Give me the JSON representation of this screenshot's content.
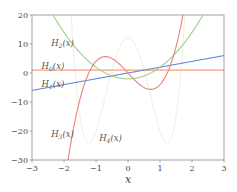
{
  "chart_data": {
    "type": "line",
    "title": "",
    "xlabel": "x",
    "ylabel": "",
    "xlim": [
      -3,
      3
    ],
    "ylim": [
      -30,
      20
    ],
    "xticks": [
      -3,
      -2,
      -1,
      0,
      1,
      2,
      3
    ],
    "yticks": [
      -30,
      -20,
      -10,
      0,
      10,
      20
    ],
    "xtick_labels": [
      "−3",
      "−2",
      "−1",
      "0",
      "1",
      "2",
      "3"
    ],
    "ytick_labels": [
      "−30",
      "−20",
      "−10",
      "0",
      "10",
      "20"
    ],
    "grid": false,
    "legend": "inline labels",
    "series": [
      {
        "name": "H_0(x)",
        "label": "H0(x)",
        "formula": "1",
        "coeffs": [
          1
        ],
        "color": "#f4a07a",
        "label_pos": [
          -2.7,
          2.5
        ]
      },
      {
        "name": "H_1(x)",
        "label": "H1(x)",
        "formula": "2x",
        "coeffs": [
          0,
          2
        ],
        "color": "#6a86d8",
        "label_pos": [
          -2.7,
          -3.7
        ]
      },
      {
        "name": "H_2(x)",
        "label": "H2(x)",
        "formula": "4x^2-2",
        "coeffs": [
          -2,
          0,
          4
        ],
        "color": "#9dd08f",
        "label_pos": [
          -2.4,
          10.5
        ]
      },
      {
        "name": "H_3(x)",
        "label": "H3(x)",
        "formula": "8x^3-12x",
        "coeffs": [
          0,
          -12,
          0,
          8
        ],
        "color": "#e8837a",
        "label_pos": [
          -2.4,
          -21
        ]
      },
      {
        "name": "H_4(x)",
        "label": "H4(x)",
        "formula": "16x^4-48x^2+12",
        "coeffs": [
          12,
          0,
          -48,
          0,
          16
        ],
        "color": "#eef2e4",
        "label_pos": [
          -0.9,
          -22.5
        ]
      }
    ]
  },
  "labels": {
    "H0": "H",
    "H0_sub": "0",
    "H1": "H",
    "H1_sub": "1",
    "H2": "H",
    "H2_sub": "2",
    "H3": "H",
    "H3_sub": "3",
    "H4": "H",
    "H4_sub": "4",
    "arg": "(x)"
  }
}
